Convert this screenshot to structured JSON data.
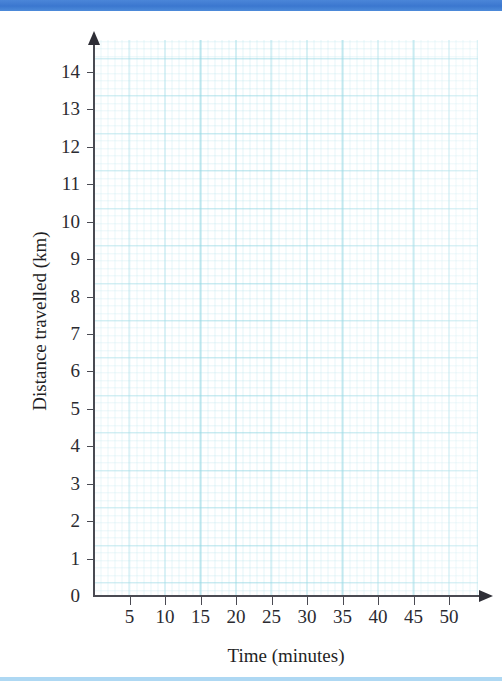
{
  "page": {
    "top_bar_color": "#3b77cf",
    "bottom_bar_color": "#aed8f3",
    "background_color": "#ffffff"
  },
  "chart_data": {
    "type": "line",
    "title": "",
    "subtitle": "",
    "xlabel": "Time (minutes)",
    "ylabel": "Distance travelled (km)",
    "xlim": [
      0,
      52
    ],
    "ylim": [
      0,
      14.8
    ],
    "x_ticks": [
      5,
      10,
      15,
      20,
      25,
      30,
      35,
      40,
      45,
      50
    ],
    "x_tick_labels": [
      "5",
      "10",
      "15",
      "20",
      "25",
      "30",
      "35",
      "40",
      "45",
      "50"
    ],
    "y_ticks": [
      0,
      1,
      2,
      3,
      4,
      5,
      6,
      7,
      8,
      9,
      10,
      11,
      12,
      13,
      14
    ],
    "y_tick_labels": [
      "0",
      "1",
      "2",
      "3",
      "4",
      "5",
      "6",
      "7",
      "8",
      "9",
      "10",
      "11",
      "12",
      "13",
      "14"
    ],
    "x_tick_interval": 5,
    "y_tick_interval": 1,
    "grid": true,
    "grid_color": "#7ecdd c",
    "grid_minor_subdivisions": 5,
    "legend": null,
    "series": [],
    "values": [],
    "categories": [],
    "annotations": [],
    "axis_arrows": true,
    "note": "Blank graph-paper axes, no data plotted"
  },
  "axes": {
    "y_title": "Distance travelled (km)",
    "x_title": "Time (minutes)",
    "line_color": "#4a4a52",
    "y_arrow_icon": "arrow-up-icon",
    "x_arrow_icon": "arrow-right-icon"
  }
}
